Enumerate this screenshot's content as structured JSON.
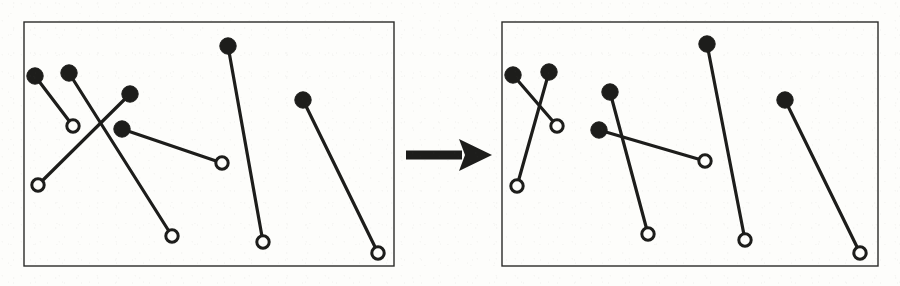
{
  "figure": {
    "type": "diagram",
    "width": 900,
    "height": 286,
    "background_color": "#fdfdfb",
    "ink_color": "#1d1d1b",
    "panel_border_color": "#2a2a28",
    "panel_border_width": 1.4,
    "segment_stroke_width": 3.2,
    "filled_dot_radius": 8.2,
    "open_circle_radius": 6.2,
    "open_circle_stroke_width": 3.0,
    "open_circle_fill": "#fdfdfb",
    "filled_dot_fill": "#1d1d1b"
  },
  "arrow": {
    "name": "transformation-arrow",
    "direction": "right",
    "color": "#1d1d1b",
    "shaft": {
      "x1": 406,
      "y1": 155,
      "x2": 462,
      "y2": 155,
      "thickness": 9
    },
    "head": {
      "tip_x": 492,
      "tip_y": 155,
      "back_x": 459,
      "half_height": 16
    }
  },
  "panels": [
    {
      "name": "before-panel",
      "label": "before",
      "rect": {
        "x": 24,
        "y": 22,
        "width": 370,
        "height": 244
      },
      "crossings": 3,
      "segments": [
        {
          "id": "seg-1",
          "label": "segment-1",
          "source": {
            "x": 35,
            "y": 76,
            "kind": "filled"
          },
          "target": {
            "x": 73,
            "y": 126,
            "kind": "open"
          }
        },
        {
          "id": "seg-2",
          "label": "segment-2",
          "source": {
            "x": 69,
            "y": 73,
            "kind": "filled"
          },
          "target": {
            "x": 172,
            "y": 236,
            "kind": "open"
          }
        },
        {
          "id": "seg-3",
          "label": "segment-3",
          "source": {
            "x": 130,
            "y": 94,
            "kind": "filled"
          },
          "target": {
            "x": 38,
            "y": 185,
            "kind": "open"
          }
        },
        {
          "id": "seg-4",
          "label": "segment-4",
          "source": {
            "x": 122,
            "y": 129,
            "kind": "filled"
          },
          "target": {
            "x": 222,
            "y": 163,
            "kind": "open"
          }
        },
        {
          "id": "seg-5",
          "label": "segment-5",
          "source": {
            "x": 228,
            "y": 46,
            "kind": "filled"
          },
          "target": {
            "x": 263,
            "y": 242,
            "kind": "open"
          }
        },
        {
          "id": "seg-6",
          "label": "segment-6",
          "source": {
            "x": 303,
            "y": 100,
            "kind": "filled"
          },
          "target": {
            "x": 378,
            "y": 253,
            "kind": "open"
          }
        }
      ]
    },
    {
      "name": "after-panel",
      "label": "after",
      "rect": {
        "x": 502,
        "y": 22,
        "width": 376,
        "height": 244
      },
      "crossings": 2,
      "segments": [
        {
          "id": "seg-1",
          "label": "segment-1",
          "source": {
            "x": 513,
            "y": 75,
            "kind": "filled"
          },
          "target": {
            "x": 557,
            "y": 126,
            "kind": "open"
          }
        },
        {
          "id": "seg-2",
          "label": "segment-2",
          "source": {
            "x": 549,
            "y": 72,
            "kind": "filled"
          },
          "target": {
            "x": 517,
            "y": 186,
            "kind": "open"
          }
        },
        {
          "id": "seg-3",
          "label": "segment-3",
          "source": {
            "x": 610,
            "y": 92,
            "kind": "filled"
          },
          "target": {
            "x": 648,
            "y": 234,
            "kind": "open"
          }
        },
        {
          "id": "seg-4",
          "label": "segment-4",
          "source": {
            "x": 599,
            "y": 130,
            "kind": "filled"
          },
          "target": {
            "x": 705,
            "y": 161,
            "kind": "open"
          }
        },
        {
          "id": "seg-5",
          "label": "segment-5",
          "source": {
            "x": 707,
            "y": 44,
            "kind": "filled"
          },
          "target": {
            "x": 745,
            "y": 240,
            "kind": "open"
          }
        },
        {
          "id": "seg-6",
          "label": "segment-6",
          "source": {
            "x": 785,
            "y": 100,
            "kind": "filled"
          },
          "target": {
            "x": 860,
            "y": 253,
            "kind": "open"
          }
        }
      ]
    }
  ]
}
